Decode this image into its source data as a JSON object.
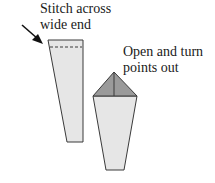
{
  "diagram": {
    "labels": {
      "stitch": [
        "Stitch across",
        "wide end"
      ],
      "open": [
        "Open and turn",
        "points out"
      ]
    },
    "colors": {
      "fabric_fill": "#e6e6e6",
      "point_fill": "#9a9a9a",
      "outline": "#3a3a3a",
      "text": "#1a1a1a"
    }
  }
}
